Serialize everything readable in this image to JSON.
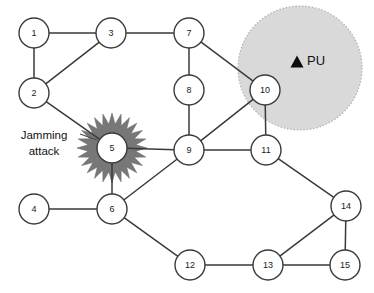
{
  "diagram": {
    "width": 374,
    "height": 293,
    "background_color": "#ffffff",
    "node_fill_color": "#ffffff",
    "node_stroke_color": "#3a3a3a",
    "edge_color": "#3a3a3a",
    "node_radius": 15
  },
  "nodes": [
    {
      "id": "1",
      "label": "1",
      "x": 34,
      "y": 33
    },
    {
      "id": "2",
      "label": "2",
      "x": 34,
      "y": 93
    },
    {
      "id": "3",
      "label": "3",
      "x": 111,
      "y": 33
    },
    {
      "id": "4",
      "label": "4",
      "x": 34,
      "y": 209
    },
    {
      "id": "5",
      "label": "5",
      "x": 112,
      "y": 148
    },
    {
      "id": "6",
      "label": "6",
      "x": 112,
      "y": 209
    },
    {
      "id": "7",
      "label": "7",
      "x": 189,
      "y": 33
    },
    {
      "id": "8",
      "label": "8",
      "x": 189,
      "y": 90
    },
    {
      "id": "9",
      "label": "9",
      "x": 189,
      "y": 150
    },
    {
      "id": "10",
      "label": "10",
      "x": 265,
      "y": 90
    },
    {
      "id": "11",
      "label": "11",
      "x": 266,
      "y": 150
    },
    {
      "id": "12",
      "label": "12",
      "x": 190,
      "y": 265
    },
    {
      "id": "13",
      "label": "13",
      "x": 268,
      "y": 265
    },
    {
      "id": "14",
      "label": "14",
      "x": 346,
      "y": 206
    },
    {
      "id": "15",
      "label": "15",
      "x": 345,
      "y": 265
    }
  ],
  "edges": [
    {
      "from": "1",
      "to": "3"
    },
    {
      "from": "1",
      "to": "2"
    },
    {
      "from": "2",
      "to": "3"
    },
    {
      "from": "2",
      "to": "5"
    },
    {
      "from": "3",
      "to": "7"
    },
    {
      "from": "7",
      "to": "8"
    },
    {
      "from": "7",
      "to": "10"
    },
    {
      "from": "8",
      "to": "9"
    },
    {
      "from": "5",
      "to": "9"
    },
    {
      "from": "5",
      "to": "6"
    },
    {
      "from": "4",
      "to": "6"
    },
    {
      "from": "6",
      "to": "9"
    },
    {
      "from": "6",
      "to": "12"
    },
    {
      "from": "9",
      "to": "10"
    },
    {
      "from": "9",
      "to": "11"
    },
    {
      "from": "10",
      "to": "11"
    },
    {
      "from": "11",
      "to": "14"
    },
    {
      "from": "12",
      "to": "13"
    },
    {
      "from": "13",
      "to": "14"
    },
    {
      "from": "13",
      "to": "15"
    },
    {
      "from": "14",
      "to": "15"
    }
  ],
  "pu_region": {
    "name": "primary-user-coverage",
    "center_x": 300,
    "center_y": 68,
    "radius": 62,
    "fill_color": "#d9d9d9",
    "border_color": "#b0b0b0",
    "border_style": "dotted"
  },
  "pu_marker": {
    "label": "PU",
    "marker_shape": "triangle",
    "marker_color": "#0d0d0d",
    "marker_x": 297,
    "marker_y": 62,
    "label_x": 307,
    "label_y": 62
  },
  "jamming": {
    "label_line1": "Jamming",
    "label_line2": "attack",
    "label_x": 44,
    "label_y1": 139,
    "label_y2": 155,
    "target_node": "5",
    "burst_center_x": 112,
    "burst_center_y": 148,
    "burst_outer_radius": 35,
    "burst_inner_radius": 24,
    "burst_points": 24,
    "burst_color": "#777777",
    "leader_from_x": 80,
    "leader_from_y": 134,
    "leader_to_x": 97,
    "leader_to_y": 140
  }
}
